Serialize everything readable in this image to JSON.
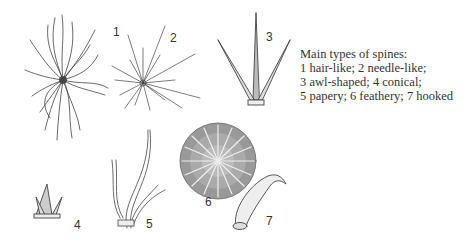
{
  "figure": {
    "caption": {
      "title": "Main types of spines:",
      "lines": [
        "1 hair-like; 2 needle-like;",
        "3 awl-shaped; 4 conical;",
        "5 papery; 6 feathery; 7 hooked"
      ]
    },
    "labels": [
      {
        "id": "1",
        "type": "hair-like"
      },
      {
        "id": "2",
        "type": "needle-like"
      },
      {
        "id": "3",
        "type": "awl-shaped"
      },
      {
        "id": "4",
        "type": "conical"
      },
      {
        "id": "5",
        "type": "papery"
      },
      {
        "id": "6",
        "type": "feathery"
      },
      {
        "id": "7",
        "type": "hooked"
      }
    ],
    "colors": {
      "ink": "#333333",
      "background": "#ffffff"
    }
  }
}
